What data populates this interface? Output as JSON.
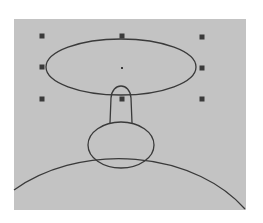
{
  "canvas": {
    "width": 263,
    "height": 223,
    "background": "#ffffff",
    "panel": {
      "x": 14,
      "y": 19,
      "width": 232,
      "height": 191,
      "fill": "#c3c3c3"
    },
    "stroke_color": "#3a3a3a"
  },
  "shapes": {
    "selected_ellipse": {
      "cx": 121,
      "cy": 67,
      "rx": 75,
      "ry": 28
    },
    "stem": {
      "cx": 121,
      "top": 84,
      "bottom": 123,
      "half_width": 11
    },
    "small_ellipse": {
      "cx": 121,
      "cy": 145,
      "rx": 33,
      "ry": 23
    },
    "large_arc": {
      "x_left": 14,
      "y_left": 190,
      "top_x": 118,
      "top_y": 151,
      "x_right": 245,
      "y_right": 209
    }
  },
  "selection_handles": [
    {
      "name": "top-left",
      "x": 42,
      "y": 36
    },
    {
      "name": "top-center",
      "x": 122,
      "y": 36
    },
    {
      "name": "top-right",
      "x": 202,
      "y": 37
    },
    {
      "name": "middle-left",
      "x": 42,
      "y": 67
    },
    {
      "name": "center",
      "x": 122,
      "y": 68
    },
    {
      "name": "middle-right",
      "x": 202,
      "y": 68
    },
    {
      "name": "bottom-left",
      "x": 42,
      "y": 99
    },
    {
      "name": "bottom-center",
      "x": 122,
      "y": 99
    },
    {
      "name": "bottom-right",
      "x": 202,
      "y": 99
    }
  ],
  "handle_color": "#3a3a3a"
}
